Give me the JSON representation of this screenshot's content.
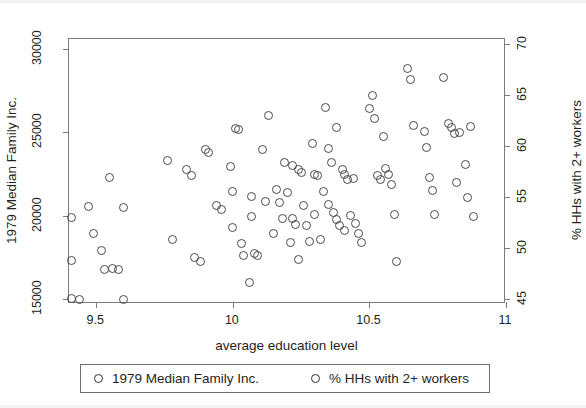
{
  "chart_data": {
    "type": "scatter",
    "title": "",
    "xlabel": "average education level",
    "ylabel": "1979 Median Family Inc.",
    "ylabel_right": "% HHs with 2+ workers",
    "xlim": [
      9.4,
      11.0
    ],
    "ylim": [
      14700,
      30600
    ],
    "ylim_right": [
      44.5,
      70.5
    ],
    "xticks": [
      "9.5",
      "10",
      "10.5",
      "11"
    ],
    "xtick_values": [
      9.5,
      10,
      10.5,
      11
    ],
    "yticks": [
      "15000",
      "20000",
      "25000",
      "30000"
    ],
    "ytick_values": [
      15000,
      20000,
      25000,
      30000
    ],
    "yticks_right": [
      "45",
      "50",
      "55",
      "60",
      "65",
      "70"
    ],
    "ytick_values_right": [
      45,
      50,
      55,
      60,
      65,
      70
    ],
    "grid": false,
    "legend_position": "below-axes",
    "marker": "open-circle",
    "marker_color": "#4a4a4a",
    "frame_color": "#7c7c7c",
    "series": [
      {
        "name": "1979 Median Family Inc.",
        "axis": "left",
        "points": [
          [
            9.41,
            19900
          ],
          [
            9.41,
            15050
          ],
          [
            9.41,
            17300
          ],
          [
            9.44,
            15000
          ],
          [
            9.47,
            20550
          ],
          [
            9.49,
            18950
          ],
          [
            9.52,
            17900
          ],
          [
            9.53,
            16800
          ],
          [
            9.55,
            22300
          ],
          [
            9.56,
            16850
          ],
          [
            9.58,
            16750
          ],
          [
            9.6,
            20500
          ],
          [
            9.6,
            14950
          ],
          [
            9.76,
            23300
          ],
          [
            9.78,
            18600
          ],
          [
            9.83,
            22750
          ],
          [
            9.85,
            22400
          ],
          [
            9.86,
            17500
          ],
          [
            9.88,
            17250
          ],
          [
            9.9,
            24000
          ],
          [
            9.91,
            23800
          ],
          [
            9.94,
            20600
          ],
          [
            9.96,
            20350
          ],
          [
            9.99,
            22950
          ],
          [
            10.0,
            21450
          ],
          [
            10.0,
            19300
          ],
          [
            10.01,
            25250
          ],
          [
            10.02,
            25200
          ],
          [
            10.03,
            18350
          ],
          [
            10.04,
            17600
          ],
          [
            10.06,
            16000
          ],
          [
            10.07,
            21150
          ],
          [
            10.07,
            19950
          ],
          [
            10.08,
            17750
          ],
          [
            10.09,
            17600
          ],
          [
            10.11,
            23950
          ],
          [
            10.12,
            20850
          ],
          [
            10.13,
            26000
          ],
          [
            10.15,
            18950
          ],
          [
            10.16,
            21600
          ],
          [
            10.17,
            20800
          ],
          [
            10.18,
            19850
          ],
          [
            10.19,
            23200
          ],
          [
            10.2,
            21400
          ],
          [
            10.21,
            18400
          ],
          [
            10.22,
            23000
          ],
          [
            10.22,
            19850
          ],
          [
            10.23,
            19500
          ],
          [
            10.24,
            22750
          ],
          [
            10.24,
            17350
          ],
          [
            10.25,
            22600
          ],
          [
            10.26,
            20600
          ],
          [
            10.27,
            19400
          ],
          [
            10.28,
            18450
          ],
          [
            10.29,
            24350
          ],
          [
            10.3,
            22500
          ],
          [
            10.3,
            20100
          ],
          [
            10.31,
            22400
          ],
          [
            10.32,
            18550
          ],
          [
            10.33,
            21450
          ],
          [
            10.34,
            26500
          ],
          [
            10.35,
            24050
          ],
          [
            10.35,
            20700
          ],
          [
            10.36,
            23200
          ],
          [
            10.37,
            20200
          ],
          [
            10.38,
            19750
          ],
          [
            10.38,
            25300
          ],
          [
            10.39,
            19400
          ],
          [
            10.4,
            22750
          ],
          [
            10.41,
            22500
          ],
          [
            10.41,
            19100
          ],
          [
            10.42,
            22200
          ],
          [
            10.43,
            20000
          ],
          [
            10.44,
            22250
          ],
          [
            10.45,
            19550
          ],
          [
            10.46,
            18950
          ],
          [
            10.47,
            18400
          ],
          [
            10.5,
            26450
          ],
          [
            10.51,
            27200
          ],
          [
            10.52,
            25850
          ],
          [
            10.53,
            22400
          ],
          [
            10.54,
            22150
          ],
          [
            10.55,
            24750
          ],
          [
            10.56,
            22850
          ],
          [
            10.57,
            22500
          ],
          [
            10.58,
            21900
          ],
          [
            10.59,
            20050
          ],
          [
            10.6,
            17250
          ],
          [
            10.64,
            28850
          ],
          [
            10.65,
            28200
          ],
          [
            10.66,
            25400
          ],
          [
            10.7,
            25050
          ],
          [
            10.71,
            24100
          ],
          [
            10.72,
            22300
          ],
          [
            10.73,
            21500
          ],
          [
            10.74,
            20050
          ],
          [
            10.77,
            28300
          ],
          [
            10.79,
            25550
          ],
          [
            10.8,
            25300
          ],
          [
            10.81,
            24950
          ],
          [
            10.82,
            22000
          ],
          [
            10.83,
            25000
          ],
          [
            10.85,
            23100
          ],
          [
            10.86,
            21100
          ],
          [
            10.87,
            25350
          ],
          [
            10.88,
            19950
          ]
        ]
      },
      {
        "name": "% HHs with 2+ workers",
        "axis": "right",
        "points": []
      }
    ],
    "n_points": 108
  },
  "axes": {
    "left_title": "1979 Median Family Inc.",
    "right_title": "% HHs with 2+ workers",
    "bottom_title": "average education level",
    "x_tick_labels": [
      "9.5",
      "10",
      "10.5",
      "11"
    ],
    "y_tick_labels_left": [
      "15000",
      "20000",
      "25000",
      "30000"
    ],
    "y_tick_labels_right": [
      "45",
      "50",
      "55",
      "60",
      "65",
      "70"
    ]
  },
  "legend": {
    "entries": [
      {
        "label": "1979 Median Family Inc.",
        "marker": "open-circle"
      },
      {
        "label": "% HHs with 2+ workers",
        "marker": "open-circle"
      }
    ]
  },
  "colors": {
    "marker_stroke": "#4a4a4a",
    "frame": "#7c7c7c",
    "text": "#231f20",
    "background": "#ffffff"
  }
}
